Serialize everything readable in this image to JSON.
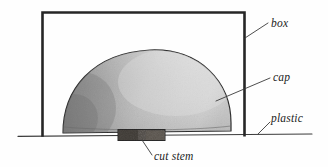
{
  "figure": {
    "background_color": "#fefefe",
    "ink_color": "#262626",
    "label_color": "#1c1c1c"
  },
  "labels": {
    "box": "box",
    "cap": "cap",
    "plastic": "plastic",
    "cut_stem": "cut stem"
  },
  "parts": {
    "box": {
      "name": "box",
      "description": "open-bottom rectangular box enclosing the cap",
      "stroke_color": "#262626"
    },
    "cap": {
      "name": "cap",
      "description": "domed mushroom cap, dark shading at left fading lighter to the right",
      "fill_dark": "#8d8d8d",
      "fill_light": "#d8d8d8",
      "stroke_color": "#2a2a2a"
    },
    "cut_stem": {
      "name": "cut stem",
      "description": "dark stub of stem beneath the cap resting on the surface",
      "fill_color": "#4a4540",
      "stroke_color": "#242424"
    },
    "plastic": {
      "name": "plastic",
      "description": "horizontal sheet the box and mushroom rest upon",
      "stroke_color": "#3b3b3b"
    }
  }
}
